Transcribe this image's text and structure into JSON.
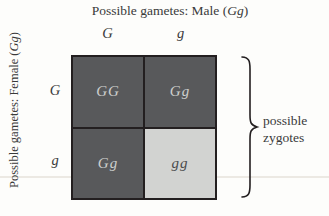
{
  "figure_type": "punnett-square",
  "colors": {
    "dark_cell": "#58595b",
    "light_cell": "#d2d3d1",
    "grid_line": "#231f20",
    "cell_text_on_dark": "#cdcfcd",
    "cell_text_on_light": "#4b4c4e",
    "label_text": "#3a3a3a",
    "faint_rule": "#ece9e3",
    "background": "#fdfdfb"
  },
  "top_label": {
    "prefix": "Possible gametes: Male (",
    "gene": "Gg",
    "suffix": ")"
  },
  "left_label": {
    "prefix": "Possible gametes: Female (",
    "gene": "Gg",
    "suffix": ")"
  },
  "column_headers": [
    "G",
    "g"
  ],
  "row_headers": [
    "G",
    "g"
  ],
  "cells": [
    [
      {
        "text": "GG",
        "shade": "dark"
      },
      {
        "text": "Gg",
        "shade": "dark"
      }
    ],
    [
      {
        "text": "Gg",
        "shade": "dark"
      },
      {
        "text": "gg",
        "shade": "light"
      }
    ]
  ],
  "brace_label": {
    "line1": "possible",
    "line2": "zygotes"
  }
}
